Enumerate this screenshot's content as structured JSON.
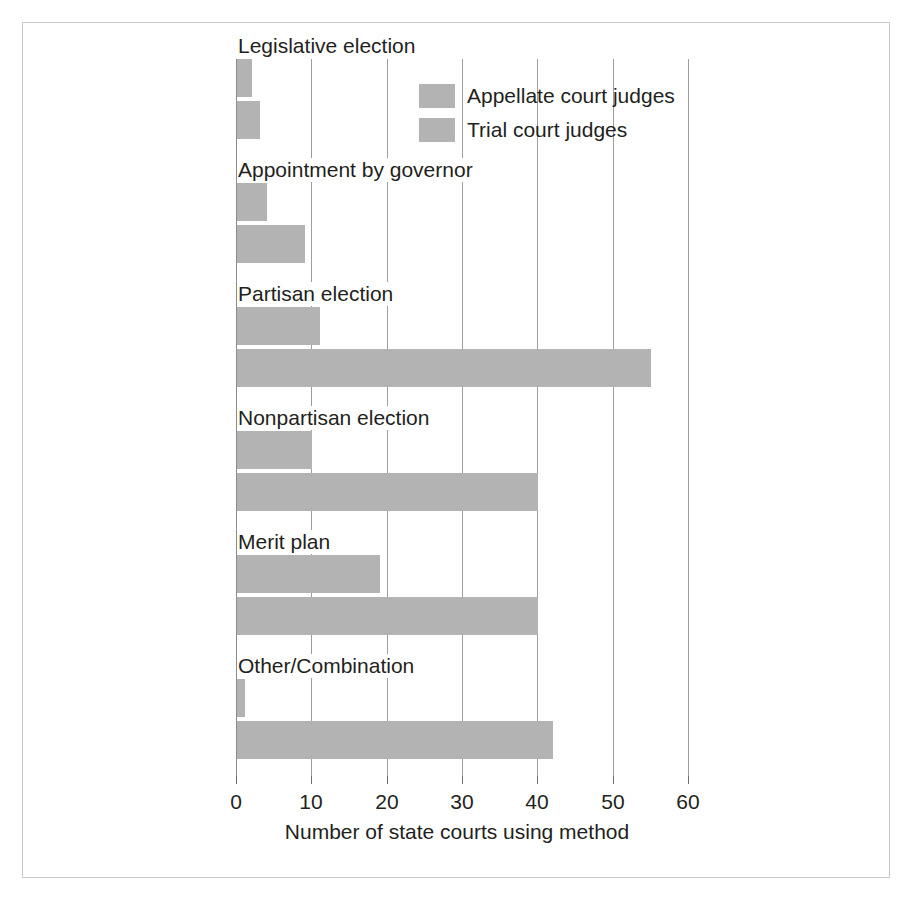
{
  "chart_data": {
    "type": "bar",
    "orientation": "horizontal",
    "title": "",
    "subtitle": "",
    "xlabel": "Number of state courts using method",
    "ylabel": "",
    "xlim": [
      0,
      60
    ],
    "xticks": [
      0,
      10,
      20,
      30,
      40,
      50,
      60
    ],
    "xticklabels": [
      "0",
      "10",
      "20",
      "30",
      "40",
      "50",
      "60"
    ],
    "grid": true,
    "grid_axis": "x",
    "legend_position": "upper-center",
    "categories": [
      "Legislative election",
      "Appointment by governor",
      "Partisan election",
      "Nonpartisan election",
      "Merit plan",
      "Other/Combination"
    ],
    "series": [
      {
        "name": "Appellate court judges",
        "color": "#b3b3b3",
        "values": [
          2,
          4,
          11,
          10,
          19,
          1
        ]
      },
      {
        "name": "Trial court judges",
        "color": "#b3b3b3",
        "values": [
          3,
          9,
          55,
          40,
          40,
          42
        ]
      }
    ],
    "legend": [
      {
        "label": "Appellate court judges",
        "color": "#b3b3b3"
      },
      {
        "label": "Trial court judges",
        "color": "#b3b3b3"
      }
    ],
    "colors": {
      "bar": "#b3b3b3",
      "gridline": "#9e9e9e",
      "text": "#231f20",
      "frame": "#c9c9c9",
      "background": "#ffffff"
    }
  }
}
